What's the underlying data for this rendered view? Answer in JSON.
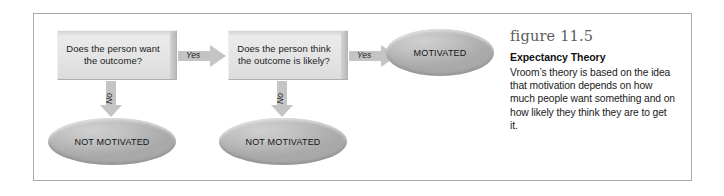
{
  "figure": {
    "number_label": "figure 11.5",
    "title": "Expectancy Theory",
    "body": "Vroom’s theory is based on the idea that motivation depends on how much people want something and on how likely they think they are to get it."
  },
  "flowchart": {
    "nodes": [
      {
        "id": "decision-1",
        "shape": "box",
        "text": "Does the person want the outcome?"
      },
      {
        "id": "decision-2",
        "shape": "box",
        "text": "Does the person think the outcome is likely?"
      },
      {
        "id": "outcome-not-motivated-1",
        "shape": "ellipse",
        "text": "NOT MOTIVATED"
      },
      {
        "id": "outcome-not-motivated-2",
        "shape": "ellipse",
        "text": "NOT MOTIVATED"
      },
      {
        "id": "outcome-motivated",
        "shape": "ellipse",
        "text": "MOTIVATED"
      }
    ],
    "edges": [
      {
        "id": "edge-yes-1",
        "label": "Yes",
        "direction": "right",
        "from": "decision-1",
        "to": "decision-2"
      },
      {
        "id": "edge-yes-2",
        "label": "Yes",
        "direction": "right",
        "from": "decision-2",
        "to": "outcome-motivated"
      },
      {
        "id": "edge-no-1",
        "label": "No",
        "direction": "down",
        "from": "decision-1",
        "to": "outcome-not-motivated-1"
      },
      {
        "id": "edge-no-2",
        "label": "No",
        "direction": "down",
        "from": "decision-2",
        "to": "outcome-not-motivated-2"
      }
    ]
  },
  "colors": {
    "frame_border": "#a9a9a9",
    "box_fill": "#e7e7e8",
    "ellipse_fill": "#b8b8b8",
    "arrow_fill": "#c4c4c4",
    "figno_text": "#5c5c5c",
    "body_text": "#1a1a1a",
    "page_background": "#ffffff"
  }
}
